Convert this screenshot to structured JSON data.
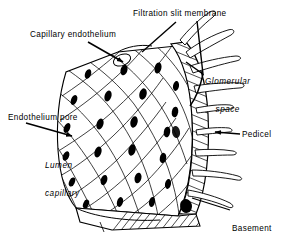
{
  "figure": {
    "background_color": "#ffffff",
    "ink_color": "#000000",
    "width": 285,
    "height": 239
  },
  "labels": {
    "filtration_slit_membrane": "Filtration slit membrane",
    "capillary_endothelium": "Capillary endothelium",
    "glomerular_space_line1": "Glomerular",
    "glomerular_space_line2": "space",
    "endothelium_pore": "Endothelium pore",
    "lumen_line1": "Lumen",
    "lumen_line2": "capillary",
    "pedicel": "Pedicel",
    "basement_line1": "Basement",
    "basement_line2": "membrane"
  },
  "structures": {
    "endothelium_surface": "fenestrated endothelial mesh with dark oval pores",
    "basement_membrane_band": "hatched band along right edge",
    "pedicels": "foot processes projecting into glomerular space",
    "cut_edge": "hatched cut edge at base of capillary"
  }
}
